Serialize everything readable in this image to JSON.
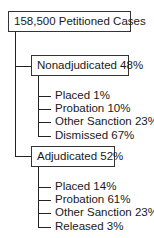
{
  "root": {
    "label": "158,500 Petitioned Cases"
  },
  "branches": [
    {
      "label": "Nonadjudicated 48%",
      "items": [
        "Placed 1%",
        "Probation 10%",
        "Other Sanction 23%",
        "Dismissed 67%"
      ]
    },
    {
      "label": "Adjudicated 52%",
      "items": [
        "Placed 14%",
        "Probation 61%",
        "Other Sanction 23%",
        "Released 3%"
      ]
    }
  ]
}
